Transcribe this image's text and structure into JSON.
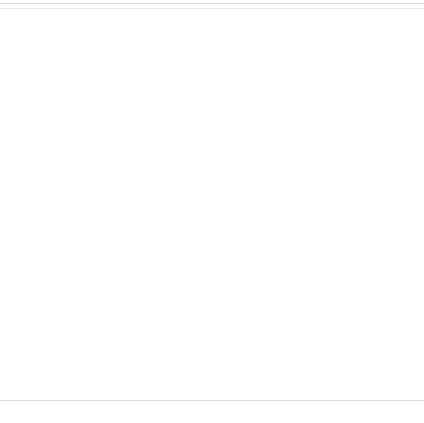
{
  "chart_data": {
    "type": "bar",
    "render": "3d-column",
    "title": "",
    "xlabel": "",
    "ylabel": "",
    "zlabel": "",
    "ylim": [
      0,
      40
    ],
    "ytick_step": 5,
    "grid": true,
    "legend_position": "right-depth-axis",
    "ytick_labels": [
      "0%",
      "5%",
      "10%",
      "15%",
      "20%",
      "25%",
      "30%",
      "35%",
      "40%"
    ],
    "ytick_values": [
      0,
      5,
      10,
      15,
      20,
      25,
      30,
      35,
      40
    ],
    "categories": [
      "Head/Face",
      "Neck",
      "Thorax",
      "Abdomen",
      "Pelvis/Hip",
      "Upper Extremity",
      "Lower Extremity"
    ],
    "series": [
      {
        "name": "Bumper/ Valence",
        "color": "#4a72ad",
        "values": [
          0.4,
          0.3,
          0.4,
          0.4,
          0.8,
          1.2,
          41.0
        ]
      },
      {
        "name": "Hood surface",
        "color": "#383838",
        "values": [
          2.6,
          0.6,
          0.5,
          0.5,
          2.2,
          2.4,
          2.5
        ]
      },
      {
        "name": "Hood edge or trim",
        "color": "#9a9a9a",
        "values": [
          1.5,
          0.6,
          0.5,
          0.5,
          0.6,
          3.3,
          1.6
        ]
      },
      {
        "name": "Windshield/ Wipers",
        "color": "#6b6b89",
        "values": [
          1.3,
          0.6,
          2.5,
          2.6,
          2.5,
          2.4,
          0.8
        ]
      },
      {
        "name": "APillar/ Header",
        "color": "#5b5585",
        "values": [
          1.4,
          0.6,
          2.4,
          23.0,
          2.5,
          2.2,
          1.6
        ]
      },
      {
        "name": "Vehicle front, NFS",
        "color": "#8b86ab",
        "values": [
          0.9,
          0.5,
          2.4,
          4.0,
          2.2,
          1.3,
          2.6
        ]
      },
      {
        "name": "Other",
        "color": "#e8702a",
        "values": [
          0.5,
          0.5,
          19.8,
          3.6,
          4.0,
          0.6,
          0.6
        ]
      },
      {
        "name": "Grille/Lights",
        "color": "#9a9a9a",
        "values": [
          0.5,
          0.5,
          0.6,
          0.6,
          0.6,
          0.6,
          2.5
        ]
      },
      {
        "name": "Undercarriage, Whe",
        "color": "#7f7f7f",
        "values": [
          0.5,
          0.5,
          0.5,
          0.5,
          0.5,
          0.6,
          3.4
        ]
      },
      {
        "name": "Environment",
        "color": "#6b8f4e",
        "values": [
          1.3,
          14.2,
          1.2,
          9.5,
          1.1,
          4.0,
          4.2
        ]
      },
      {
        "name": "Non contact",
        "color": "#9a9a9a",
        "values": [
          0.4,
          0.3,
          0.4,
          0.4,
          0.4,
          0.4,
          1.6
        ]
      },
      {
        "name": "Unknown",
        "color": "#2e2e2e",
        "values": [
          2.0,
          0.3,
          2.4,
          0.4,
          0.4,
          2.6,
          2.8
        ]
      }
    ]
  }
}
